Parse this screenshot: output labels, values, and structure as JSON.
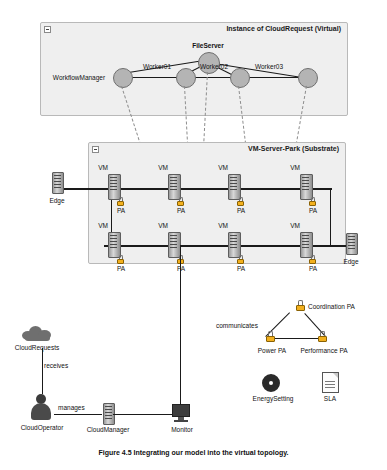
{
  "figure": {
    "caption": "Figure 4.5 Integrating our model into the virtual topology."
  },
  "panels": {
    "virtual": {
      "title": "Instance of CloudRequest (Virtual)",
      "collapse_icon": "collapse-box-icon"
    },
    "substrate": {
      "title": "VM-Server-Park (Substrate)",
      "collapse_icon": "collapse-box-icon"
    }
  },
  "virtual_nodes": [
    {
      "id": "fileserver",
      "label": "FileServer"
    },
    {
      "id": "workflowmanager",
      "label": "WorkflowManager"
    },
    {
      "id": "worker01",
      "label": "Worker01"
    },
    {
      "id": "worker02",
      "label": "Worker02"
    },
    {
      "id": "worker03",
      "label": "Worker03"
    },
    {
      "id": "worker04",
      "label": ""
    }
  ],
  "substrate": {
    "row1_labels": [
      "VM",
      "VM",
      "VM",
      "VM"
    ],
    "row2_labels": [
      "VM",
      "VM",
      "VM",
      "VM"
    ],
    "pa_row1_labels": [
      "PA",
      "PA",
      "PA",
      "PA"
    ],
    "pa_row2_labels": [
      "PA",
      "PA",
      "PA",
      "PA"
    ],
    "pa_icon": "lock-icon",
    "vm_icon": "server-rack-icon"
  },
  "edges": [
    {
      "label": "Edge",
      "icon": "server-rack-icon"
    },
    {
      "label": "Edge",
      "icon": "server-rack-icon"
    }
  ],
  "agents": {
    "coordination": {
      "label": "Coordination PA",
      "icon": "lock-icon"
    },
    "power": {
      "label": "Power PA",
      "icon": "lock-icon"
    },
    "performance": {
      "label": "Performance PA",
      "icon": "lock-icon"
    },
    "communicates_label": "communicates"
  },
  "artifacts": {
    "energy": {
      "label": "EnergySetting",
      "icon": "energy-donut-icon"
    },
    "sla": {
      "label": "SLA",
      "icon": "document-icon"
    }
  },
  "bottom": {
    "cloud_requests": {
      "label": "CloudRequests",
      "icon": "cloud-icon"
    },
    "receives_label": "receives",
    "cloud_operator": {
      "label": "CloudOperator",
      "icon": "person-icon"
    },
    "manages_label": "manages",
    "cloud_manager": {
      "label": "CloudManager",
      "icon": "server-rack-icon"
    },
    "monitor": {
      "label": "Monitor",
      "icon": "monitor-icon"
    }
  }
}
